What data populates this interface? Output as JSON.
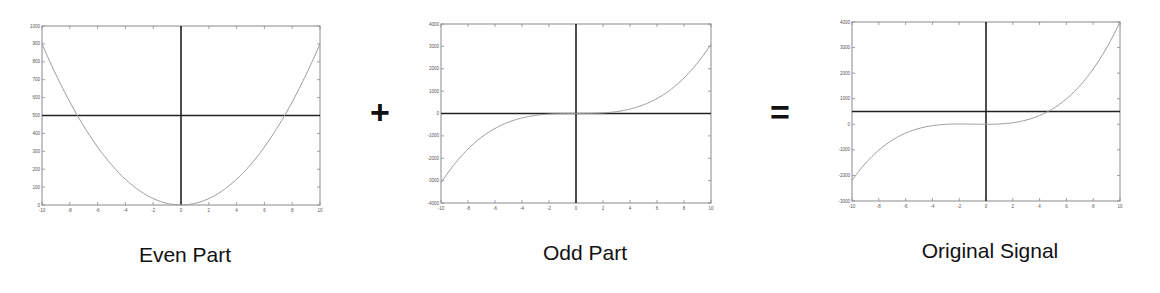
{
  "operators": {
    "plus": "+",
    "equals": "="
  },
  "captions": {
    "even": "Even Part",
    "odd": "Odd Part",
    "original": "Original Signal"
  },
  "colors": {
    "curve": "#9a9a9a",
    "axis_line": "#222222",
    "frame": "#8a8a8a",
    "text": "#111111"
  },
  "chart_data": [
    {
      "type": "line",
      "title": "Even Part",
      "xlabel": "",
      "ylabel": "",
      "xlim": [
        -10,
        10
      ],
      "ylim": [
        0,
        1000
      ],
      "xticks": [
        -10,
        -8,
        -6,
        -4,
        -2,
        0,
        2,
        4,
        6,
        8,
        10
      ],
      "yticks": [
        0,
        100,
        200,
        300,
        400,
        500,
        600,
        700,
        800,
        900,
        1000
      ],
      "reference_lines": {
        "horizontal_y": 500,
        "vertical_x": 0
      },
      "grid": false,
      "series": [
        {
          "name": "even",
          "x": [
            -10,
            -8,
            -6,
            -4,
            -2,
            0,
            2,
            4,
            6,
            8,
            10
          ],
          "values": [
            900,
            576,
            324,
            144,
            36,
            0,
            36,
            144,
            324,
            576,
            900
          ]
        }
      ]
    },
    {
      "type": "line",
      "title": "Odd Part",
      "xlabel": "",
      "ylabel": "",
      "xlim": [
        -10,
        10
      ],
      "ylim": [
        -4000,
        4000
      ],
      "xticks": [
        -10,
        -8,
        -6,
        -4,
        -2,
        0,
        2,
        4,
        6,
        8,
        10
      ],
      "yticks": [
        -4000,
        -3000,
        -2000,
        -1000,
        0,
        1000,
        2000,
        3000,
        4000
      ],
      "reference_lines": {
        "horizontal_y": 0,
        "vertical_x": 0
      },
      "grid": false,
      "series": [
        {
          "name": "odd",
          "x": [
            -10,
            -8,
            -6,
            -4,
            -2,
            0,
            2,
            4,
            6,
            8,
            10
          ],
          "values": [
            -3100,
            -1587,
            -670,
            -198,
            -25,
            0,
            25,
            198,
            670,
            1587,
            3100
          ]
        }
      ]
    },
    {
      "type": "line",
      "title": "Original Signal",
      "xlabel": "",
      "ylabel": "",
      "xlim": [
        -10,
        10
      ],
      "ylim": [
        -3000,
        4000
      ],
      "xticks": [
        -10,
        -8,
        -6,
        -4,
        -2,
        0,
        2,
        4,
        6,
        8,
        10
      ],
      "yticks": [
        -3000,
        -2000,
        -1000,
        0,
        1000,
        2000,
        3000,
        4000
      ],
      "reference_lines": {
        "horizontal_y": 500,
        "vertical_x": 0
      },
      "grid": false,
      "series": [
        {
          "name": "original",
          "x": [
            -10,
            -8,
            -6,
            -4,
            -2,
            0,
            2,
            4,
            6,
            8,
            10
          ],
          "values": [
            -2200,
            -1011,
            -346,
            -54,
            11,
            0,
            61,
            342,
            994,
            2163,
            4000
          ]
        }
      ]
    }
  ],
  "panels": [
    {
      "key": "even",
      "box": [
        42,
        26,
        320,
        205
      ],
      "fn": "even"
    },
    {
      "key": "odd",
      "box": [
        441,
        24,
        711,
        203
      ],
      "fn": "odd"
    },
    {
      "key": "original",
      "box": [
        852,
        22,
        1120,
        201
      ],
      "fn": "original"
    }
  ]
}
